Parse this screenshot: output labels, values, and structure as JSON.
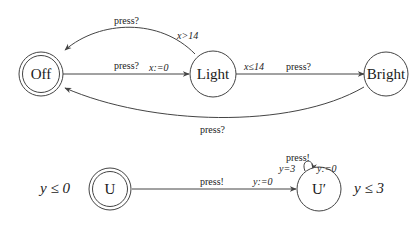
{
  "automaton_light": {
    "states": [
      {
        "id": "off",
        "label": "Off",
        "initial": true
      },
      {
        "id": "light",
        "label": "Light",
        "initial": false
      },
      {
        "id": "bright",
        "label": "Bright",
        "initial": false
      }
    ],
    "edges": [
      {
        "id": "off-to-light",
        "sync": "press?",
        "update": "x:=0"
      },
      {
        "id": "light-to-off",
        "sync": "press?",
        "guard": "x>14"
      },
      {
        "id": "light-to-bright",
        "guard": "x≤14",
        "sync": "press?"
      },
      {
        "id": "bright-to-off",
        "sync": "press?"
      }
    ]
  },
  "automaton_user": {
    "states": [
      {
        "id": "u",
        "label": "U",
        "initial": true,
        "invariant": "y ≤ 0"
      },
      {
        "id": "u-prime",
        "label": "U′",
        "initial": false,
        "invariant": "y ≤ 3"
      }
    ],
    "edges": [
      {
        "id": "u-to-uprime",
        "sync": "press!",
        "update": "y:=0"
      },
      {
        "id": "uprime-self-loop",
        "sync": "press!",
        "guard": "y=3",
        "update": "y:=0"
      }
    ]
  }
}
